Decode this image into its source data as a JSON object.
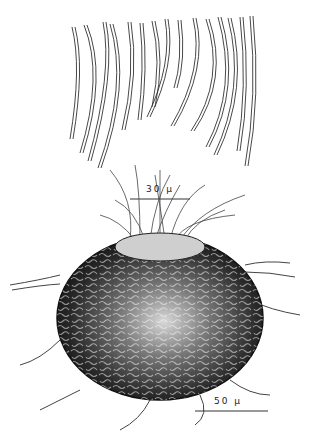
{
  "figure": {
    "scale_bar_top": {
      "label": "30 µ"
    },
    "scale_bar_bottom": {
      "label": "50 µ"
    },
    "colors": {
      "ink": "#1a1a1a",
      "paper": "#ffffff"
    }
  }
}
